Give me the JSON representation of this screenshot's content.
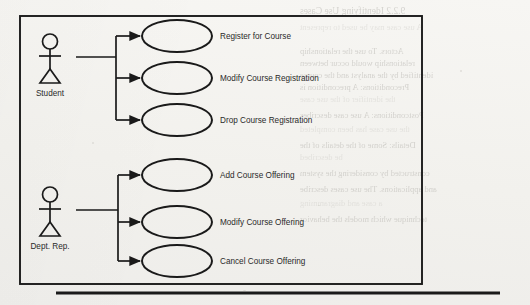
{
  "page": {
    "background_color": "#f5f4f1",
    "ink_color": "#1a1a1a",
    "bleed_color": "#b9b7b2"
  },
  "diagram": {
    "type": "uml-use-case-diagram",
    "system_boundary": {
      "x": 20,
      "y": 16,
      "width": 402,
      "height": 268
    },
    "actors": [
      {
        "id": "student",
        "label": "Student",
        "x": 50,
        "y": 34,
        "label_y": 96,
        "stem_y": 57
      },
      {
        "id": "dept-rep",
        "label": "Dept. Rep.",
        "x": 50,
        "y": 187,
        "label_y": 249,
        "stem_y": 210
      }
    ],
    "use_cases": [
      {
        "id": "register-for-course",
        "label": "Register for Course",
        "cx": 177,
        "cy": 36,
        "rx": 35,
        "ry": 16,
        "actor": "student"
      },
      {
        "id": "modify-course-registration",
        "label": "Modify Course Registration",
        "cx": 177,
        "cy": 78,
        "rx": 35,
        "ry": 16,
        "actor": "student"
      },
      {
        "id": "drop-course-registration",
        "label": "Drop Course Registration",
        "cx": 177,
        "cy": 120,
        "rx": 35,
        "ry": 16,
        "actor": "student"
      },
      {
        "id": "add-course-offering",
        "label": "Add Course Offering",
        "cx": 177,
        "cy": 175,
        "rx": 35,
        "ry": 16,
        "actor": "dept-rep"
      },
      {
        "id": "modify-course-offering",
        "label": "Modify Course Offering",
        "cx": 177,
        "cy": 222,
        "rx": 35,
        "ry": 16,
        "actor": "dept-rep"
      },
      {
        "id": "cancel-course-offering",
        "label": "Cancel Course Offering",
        "cx": 177,
        "cy": 261,
        "rx": 35,
        "ry": 16,
        "actor": "dept-rep"
      }
    ],
    "label_x": 220,
    "trunks": [
      {
        "id": "student-trunk",
        "x": 116,
        "stem_from": 76,
        "stem_y": 57,
        "top": 36,
        "bottom": 120
      },
      {
        "id": "dept-rep-trunk",
        "x": 118,
        "stem_from": 76,
        "stem_y": 210,
        "top": 175,
        "bottom": 261
      }
    ],
    "footer_rule": {
      "x1": 56,
      "x2": 500,
      "y": 293
    }
  },
  "bleed_text": {
    "lines": [
      {
        "text": "9.2.2  Identifying Use Cases",
        "x": 300,
        "y": 6,
        "size": 9.5,
        "faint": false
      },
      {
        "text": "A use case may be used to represent",
        "x": 300,
        "y": 22,
        "size": 8.5,
        "faint": true
      },
      {
        "text": "Actors.  To use the relationship",
        "x": 300,
        "y": 46,
        "size": 8.5,
        "faint": false
      },
      {
        "text": "relationship would occur between",
        "x": 300,
        "y": 58,
        "size": 8.5,
        "faint": false
      },
      {
        "text": "identified by the analyst and the course",
        "x": 300,
        "y": 70,
        "size": 8.5,
        "faint": false
      },
      {
        "text": "Preconditions: A precondition is",
        "x": 300,
        "y": 82,
        "size": 8.5,
        "faint": false
      },
      {
        "text": "the identifier of the use case",
        "x": 300,
        "y": 94,
        "size": 8.5,
        "faint": true
      },
      {
        "text": "Postconditions: A use case describes",
        "x": 300,
        "y": 110,
        "size": 8.5,
        "faint": false
      },
      {
        "text": "the use case has been completed",
        "x": 300,
        "y": 124,
        "size": 8.5,
        "faint": true
      },
      {
        "text": "Details:  Some of the details of the",
        "x": 300,
        "y": 140,
        "size": 8.5,
        "faint": false
      },
      {
        "text": "be described",
        "x": 300,
        "y": 152,
        "size": 8.5,
        "faint": true
      },
      {
        "text": "constructed by considering the system",
        "x": 300,
        "y": 168,
        "size": 8.5,
        "faint": false
      },
      {
        "text": "and applications. The use cases describe",
        "x": 300,
        "y": 184,
        "size": 8.5,
        "faint": false
      },
      {
        "text": "a case and diagramming",
        "x": 300,
        "y": 198,
        "size": 8.5,
        "faint": true
      },
      {
        "text": "technique which models the behavior",
        "x": 300,
        "y": 214,
        "size": 8.5,
        "faint": false
      }
    ]
  }
}
